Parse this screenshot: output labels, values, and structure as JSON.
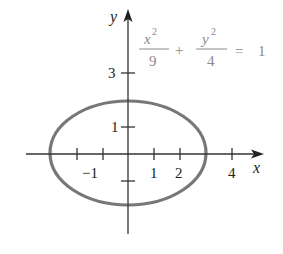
{
  "diagram": {
    "equation": {
      "term1_num": "x",
      "term1_num_exp": "2",
      "term1_den": "9",
      "plus": "+",
      "term2_num": "y",
      "term2_num_exp": "2",
      "term2_den": "4",
      "equals": "=",
      "rhs": "1"
    },
    "axes": {
      "x_label": "x",
      "y_label": "y",
      "x_tick_labels": [
        "−1",
        "1",
        "2",
        "4"
      ],
      "y_tick_labels": [
        "1",
        "3"
      ]
    },
    "ellipse": {
      "semi_major_x": 3,
      "semi_minor_y": 2,
      "stroke_color": "#777777"
    },
    "colors": {
      "axis": "#333333",
      "equation_text": "#8a8a8a"
    }
  }
}
